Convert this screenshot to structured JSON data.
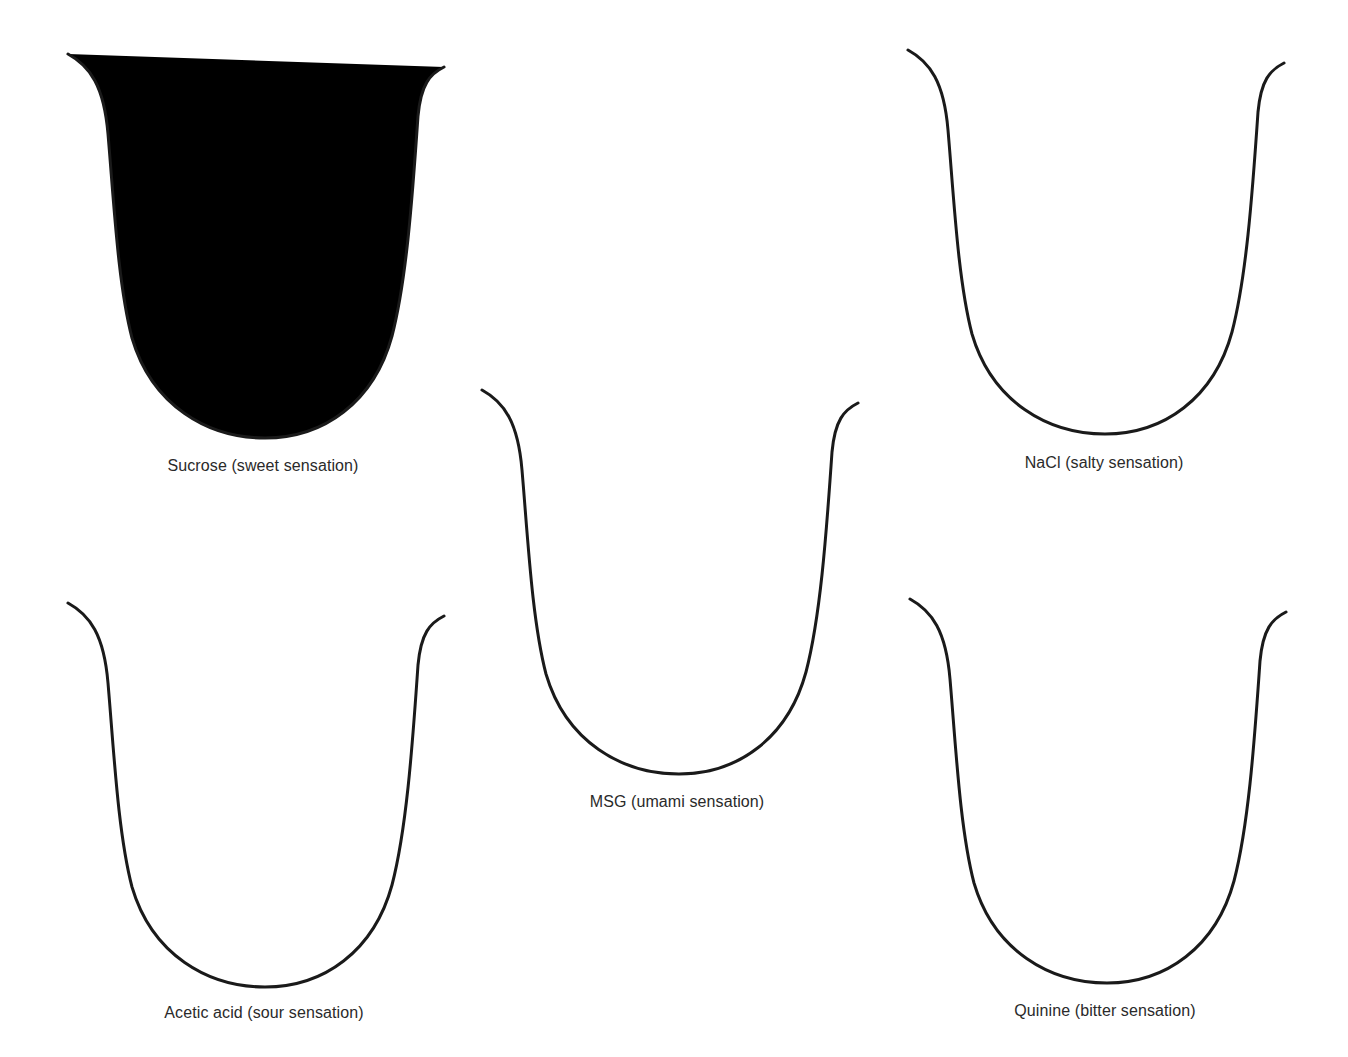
{
  "diagram": {
    "type": "taste-sensation-tongue-outlines",
    "stroke_color": "#1a1a1a",
    "label_color": "#2a2a2a",
    "panels": [
      {
        "id": "sucrose",
        "label": "Sucrose (sweet sensation)",
        "substance": "Sucrose",
        "taste": "sweet",
        "position": "top-left"
      },
      {
        "id": "nacl",
        "label": "NaCl (salty sensation)",
        "substance": "NaCl",
        "taste": "salty",
        "position": "top-right"
      },
      {
        "id": "msg",
        "label": "MSG (umami sensation)",
        "substance": "MSG",
        "taste": "umami",
        "position": "center"
      },
      {
        "id": "acetic",
        "label": "Acetic acid (sour sensation)",
        "substance": "Acetic acid",
        "taste": "sour",
        "position": "bottom-left"
      },
      {
        "id": "quinine",
        "label": "Quinine (bitter sensation)",
        "substance": "Quinine",
        "taste": "bitter",
        "position": "bottom-right"
      }
    ]
  }
}
